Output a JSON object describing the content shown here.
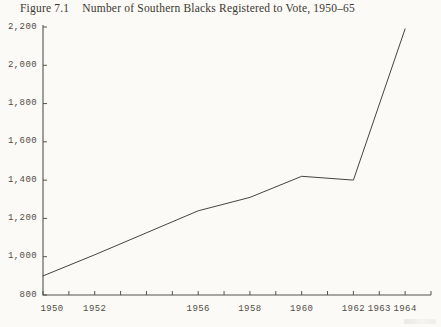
{
  "page": {
    "background": "#fbfaf6"
  },
  "figure": {
    "label": "Figure 7.1",
    "title": "Number of Southern Blacks Registered to Vote, 1950–65"
  },
  "chart_data": {
    "type": "line",
    "figure_label": "Figure 7.1",
    "title": "Number of Southern Blacks Registered to Vote, 1950–65",
    "x": [
      1950,
      1952,
      1956,
      1958,
      1960,
      1962,
      1964
    ],
    "values": [
      900,
      1010,
      1240,
      1310,
      1420,
      1400,
      2190
    ],
    "xlim": [
      1950,
      1965
    ],
    "ylim": [
      800,
      2200
    ],
    "x_minor_tick_interval": 1,
    "y_tick_interval": 200,
    "y_tick_labels": [
      "800",
      "1,000",
      "1,200",
      "1,400",
      "1,600",
      "1,800",
      "2,000",
      "2,200"
    ],
    "x_axis_labels": [
      {
        "year": 1950,
        "text": "1950"
      },
      {
        "year": 1952,
        "text": "1952"
      },
      {
        "year": 1956,
        "text": "1956"
      },
      {
        "year": 1958,
        "text": "1958"
      },
      {
        "year": 1960,
        "text": "1960"
      },
      {
        "year": 1962,
        "text": "1962"
      },
      {
        "year": 1963,
        "text": "1963"
      },
      {
        "year": 1964,
        "text": "1964"
      }
    ],
    "grid": false,
    "legend": false,
    "line_color": "#45443f",
    "axis_color": "#55534d",
    "label_color": "#514e47",
    "title_color": "#3c3831"
  }
}
